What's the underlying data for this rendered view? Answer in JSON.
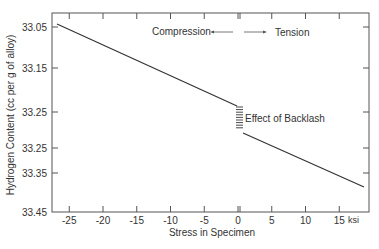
{
  "chart_data": {
    "type": "line",
    "title": "",
    "xlabel": "Stress in Specimen",
    "ylabel": "Hydrogen Content (cc per g of alloy)",
    "x_unit": "ksi",
    "xlim": [
      -26,
      19.5
    ],
    "ylim": [
      33.45,
      33.0
    ],
    "x_ticks": [
      -25,
      -20,
      -15,
      -10,
      -5,
      0,
      5,
      10,
      15
    ],
    "x_tick_labels": [
      "-25",
      "-20",
      "-15",
      "-10",
      "-5",
      "0",
      "5",
      "10",
      "15"
    ],
    "y_ticks": [
      33.05,
      33.15,
      33.25,
      33.25,
      33.35,
      33.45
    ],
    "y_tick_labels": [
      "33.05",
      "33.15",
      "33.25",
      "33.25",
      "33.35",
      "33.45"
    ],
    "grid": false,
    "series": [
      {
        "name": "Compression",
        "x": [
          -25.5,
          0
        ],
        "y": [
          33.04,
          33.26
        ]
      },
      {
        "name": "Tension",
        "x": [
          0,
          19
        ],
        "y": [
          33.29,
          33.39
        ]
      }
    ],
    "annotations": [
      {
        "text": "Compression",
        "arrow": "left"
      },
      {
        "text": "Tension",
        "arrow": "right"
      },
      {
        "text": "Effect of Backlash",
        "x": 0,
        "y_range": [
          33.26,
          33.29
        ]
      }
    ]
  }
}
